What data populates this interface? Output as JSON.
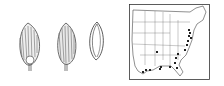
{
  "figure": {
    "panels": [
      {
        "id": "spikelet-1",
        "kind": "spikelet illustration, with basal callus"
      },
      {
        "id": "spikelet-2",
        "kind": "spikelet illustration"
      },
      {
        "id": "floret",
        "kind": "upper floret outline"
      },
      {
        "id": "distribution-map",
        "kind": "map of eastern/central United States with occurrence dots"
      }
    ],
    "map": {
      "region": "United States (eastern)",
      "points": [
        [
          189,
          30
        ],
        [
          190,
          33
        ],
        [
          189,
          36
        ],
        [
          191,
          38
        ],
        [
          188,
          40
        ],
        [
          187,
          44
        ],
        [
          185,
          50
        ],
        [
          178,
          54
        ],
        [
          176,
          58
        ],
        [
          175,
          62
        ],
        [
          177,
          67
        ],
        [
          170,
          67
        ],
        [
          169,
          68
        ],
        [
          161,
          67
        ],
        [
          160,
          69
        ],
        [
          150,
          70
        ],
        [
          143,
          72
        ],
        [
          145,
          73
        ],
        [
          146,
          70
        ],
        [
          157,
          52
        ]
      ],
      "point_color": "#222222",
      "line_color": "#333333"
    }
  }
}
